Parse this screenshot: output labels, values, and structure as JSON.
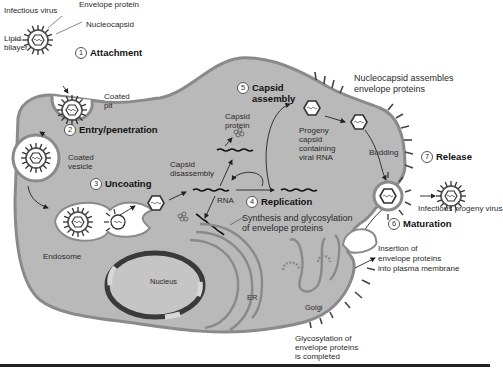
{
  "colors": {
    "cytoplasm": "#b8b8b8",
    "membrane": "#8e8e8e",
    "inner_space": "#ffffff",
    "nucleus_dark": "#3a3a3a",
    "text": "#222222"
  },
  "virus_labels": {
    "infectious_virus": "Infectious virus",
    "envelope_protein": "Envelope protein",
    "nucleocapsid": "Nucleocapsid",
    "lipid_bilayer_1": "Lipid",
    "lipid_bilayer_2": "bilayer"
  },
  "steps": [
    {
      "num": "1",
      "label": "Attachment"
    },
    {
      "num": "2",
      "label": "Entry/penetration"
    },
    {
      "num": "3",
      "label": "Uncoating"
    },
    {
      "num": "4",
      "label": "Replication"
    },
    {
      "num": "5",
      "label_line1": "Capsid",
      "label_line2": "assembly"
    },
    {
      "num": "6",
      "label": "Maturation"
    },
    {
      "num": "7",
      "label": "Release"
    }
  ],
  "annotations": {
    "coated_pit_1": "Coated",
    "coated_pit_2": "pit",
    "coated_vesicle_1": "Coated",
    "coated_vesicle_2": "vesicle",
    "endosome": "Endosome",
    "capsid_disassembly_1": "Capsid",
    "capsid_disassembly_2": "disassembly",
    "capsid_protein_1": "Capsid",
    "capsid_protein_2": "protein",
    "rna": "RNA",
    "progeny_1": "Progeny",
    "progeny_2": "capsid",
    "progeny_3": "containing",
    "progeny_4": "viral RNA",
    "nucleocapsid_assembles_1": "Nucleocapsid assembles",
    "nucleocapsid_assembles_2": "envelope proteins",
    "budding": "Budding",
    "infectious_progeny": "Infectious progeny virus",
    "synthesis_1": "Synthesis and glycosylation",
    "synthesis_2": "of envelope proteins",
    "insertion_1": "Insertion of",
    "insertion_2": "envelope proteins",
    "insertion_3": "into plasma membrane",
    "nucleus": "Nucleus",
    "er": "ER",
    "golgi": "Golgi",
    "glyco_1": "Glycosylation of",
    "glyco_2": "envelope proteins",
    "glyco_3": "is completed"
  }
}
